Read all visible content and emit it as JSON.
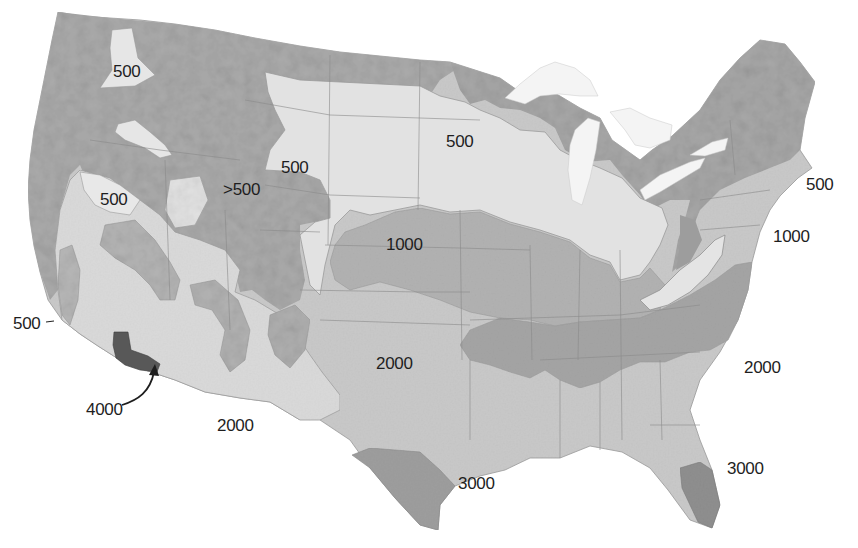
{
  "map": {
    "type": "contour_zone_map",
    "region": "Contiguous United States",
    "colors": {
      "background": "#ffffff",
      "zone_500": "#b4b4b4",
      "zone_gt500": "#a9a9a9",
      "zone_1000_light": "#e3e3e3",
      "zone_1000": "#b0b0b0",
      "zone_2000": "#c9c9c9",
      "zone_2000_dark": "#a6a6a6",
      "zone_3000": "#9a9a9a",
      "zone_4000": "#5a5a5a",
      "lakes": "#f4f4f4",
      "borders": "#8a8a8a",
      "label_text": "#1e1e1e"
    },
    "labels": [
      {
        "id": "nw-500",
        "text": "500",
        "x": 113,
        "y": 62
      },
      {
        "id": "wy-500",
        "text": "500",
        "x": 281,
        "y": 158
      },
      {
        "id": "mn-500",
        "text": "500",
        "x": 446,
        "y": 132
      },
      {
        "id": "ne-500",
        "text": "500",
        "x": 806,
        "y": 175
      },
      {
        "id": "nv-500",
        "text": "500",
        "x": 100,
        "y": 190
      },
      {
        "id": "ut-gt500",
        "text": ">500",
        "x": 223,
        "y": 180
      },
      {
        "id": "ks-1000",
        "text": "1000",
        "x": 386,
        "y": 235
      },
      {
        "id": "md-1000",
        "text": "1000",
        "x": 773,
        "y": 227
      },
      {
        "id": "ca-coast-500",
        "text": "500",
        "x": 13,
        "y": 314
      },
      {
        "id": "tx-2000",
        "text": "2000",
        "x": 376,
        "y": 354
      },
      {
        "id": "se-2000",
        "text": "2000",
        "x": 744,
        "y": 358
      },
      {
        "id": "az-2000",
        "text": "2000",
        "x": 217,
        "y": 416
      },
      {
        "id": "ca-4000",
        "text": "4000",
        "x": 86,
        "y": 400
      },
      {
        "id": "gulf-3000",
        "text": "3000",
        "x": 458,
        "y": 474
      },
      {
        "id": "fl-3000",
        "text": "3000",
        "x": 727,
        "y": 459
      }
    ],
    "legend_values": [
      "500",
      ">500",
      "1000",
      "2000",
      "3000",
      "4000"
    ]
  }
}
